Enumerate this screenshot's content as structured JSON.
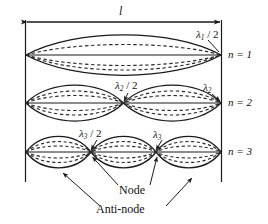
{
  "figure": {
    "length_label": "l",
    "stroke_color": "#1a1a1a",
    "dash_color": "#2b2b2b",
    "background": "#ffffff",
    "string_length_px": 197
  },
  "modes": [
    {
      "id": "n1",
      "mode_label": "n = 1",
      "wavelength_labels": [
        "λ",
        "1",
        " / 2"
      ],
      "half_wavelengths": 1,
      "nodes": 0,
      "antinodes": 1,
      "baseline_y": 55
    },
    {
      "id": "n2",
      "mode_label": "n = 2",
      "wavelength_labels_left": [
        "λ",
        "2",
        " / 2"
      ],
      "wavelength_labels_right": [
        "λ",
        "2",
        ""
      ],
      "half_wavelengths": 2,
      "nodes": 1,
      "antinodes": 2,
      "baseline_y": 103
    },
    {
      "id": "n3",
      "mode_label": "n = 3",
      "wavelength_labels_left": [
        "λ",
        "3",
        " / 2"
      ],
      "wavelength_labels_right": [
        "λ",
        "3",
        ""
      ],
      "half_wavelengths": 3,
      "nodes": 2,
      "antinodes": 3,
      "baseline_y": 152
    }
  ],
  "labels": {
    "length": "l",
    "lambda_glyph": "λ",
    "n1": "n = 1",
    "n2": "n = 2",
    "n3": "n = 3",
    "lam1_half_sub": "1",
    "lam1_half_tail": " / 2",
    "lam2_half_sub": "2",
    "lam2_half_tail": " / 2",
    "lam2_sub": "2",
    "lam3_half_sub": "3",
    "lam3_half_tail": " / 2",
    "lam3_sub": "3",
    "node": "Node",
    "antinode": "Anti-node"
  }
}
